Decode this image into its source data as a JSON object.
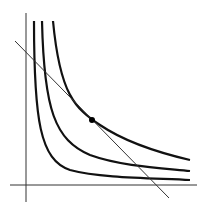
{
  "diagram": {
    "type": "indifference-curves-with-budget-line",
    "background": "#ffffff",
    "stroke_color": "#111111",
    "axes": {
      "y_axis": {
        "x": 26,
        "y1": 13,
        "y2": 202
      },
      "x_axis": {
        "y": 185,
        "x1": 10,
        "x2": 197
      }
    },
    "curves": [
      {
        "name": "indifference-curve-1",
        "d": "M34,21 C34,120 40,160 70,170 C100,178 150,178 190,180"
      },
      {
        "name": "indifference-curve-2",
        "d": "M42,21 C44,110 55,140 90,155 C120,166 160,168 190,171"
      },
      {
        "name": "indifference-curve-3",
        "d": "M53,21 C60,95 75,108 100,125 C125,142 160,153 190,160"
      }
    ],
    "budget_line": {
      "x1": 15,
      "y1": 41,
      "x2": 169,
      "y2": 198
    },
    "tangency_point": {
      "cx": 92,
      "cy": 120,
      "r": 3
    }
  }
}
